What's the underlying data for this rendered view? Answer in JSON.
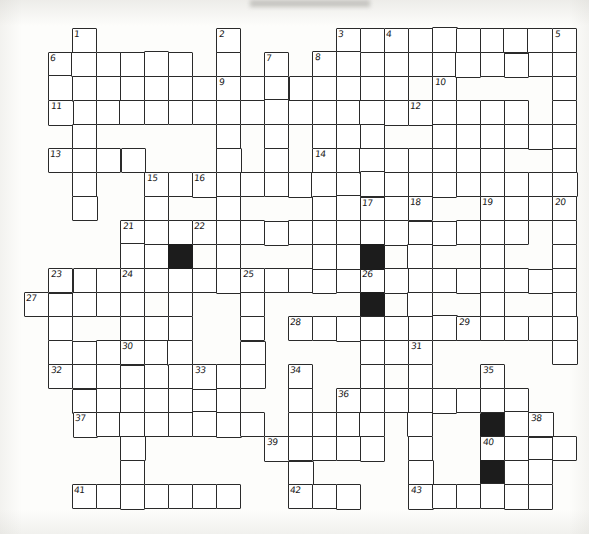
{
  "document": {
    "type": "crossword-puzzle-grid",
    "title": "Crossword puzzle grid",
    "cell_size": 24,
    "origin_x": 24,
    "origin_y": 28,
    "columns": 23,
    "rows": 21,
    "ink_color": "#2a2a2a",
    "blocked_color": "#1c1c1c",
    "paper_color": "#fdfdfb"
  },
  "grid": {
    "white_cells": [
      [
        2,
        1
      ],
      [
        2,
        2
      ],
      [
        2,
        3
      ],
      [
        1,
        2
      ],
      [
        3,
        2
      ],
      [
        4,
        2
      ],
      [
        5,
        2
      ],
      [
        6,
        2
      ],
      [
        7,
        2
      ],
      [
        8,
        1
      ],
      [
        8,
        2
      ],
      [
        8,
        3
      ],
      [
        8,
        4
      ],
      [
        8,
        5
      ],
      [
        8,
        6
      ],
      [
        8,
        7
      ],
      [
        8,
        8
      ],
      [
        10,
        2
      ],
      [
        10,
        3
      ],
      [
        10,
        4
      ],
      [
        10,
        5
      ],
      [
        12,
        1
      ],
      [
        12,
        2
      ],
      [
        12,
        3
      ],
      [
        12,
        4
      ],
      [
        12,
        5
      ],
      [
        13,
        1
      ],
      [
        13,
        2
      ],
      [
        13,
        3
      ],
      [
        13,
        4
      ],
      [
        13,
        5
      ],
      [
        13,
        6
      ],
      [
        13,
        7
      ],
      [
        13,
        8
      ],
      [
        13,
        9
      ],
      [
        13,
        10
      ],
      [
        14,
        1
      ],
      [
        15,
        1
      ],
      [
        16,
        1
      ],
      [
        17,
        1
      ],
      [
        18,
        1
      ],
      [
        19,
        1
      ],
      [
        20,
        1
      ],
      [
        21,
        1
      ],
      [
        22,
        1
      ],
      [
        22,
        2
      ],
      [
        22,
        3
      ],
      [
        22,
        4
      ],
      [
        22,
        5
      ],
      [
        22,
        6
      ],
      [
        22,
        7
      ],
      [
        22,
        8
      ],
      [
        14,
        2
      ],
      [
        14,
        3
      ],
      [
        14,
        4
      ],
      [
        14,
        5
      ],
      [
        1,
        3
      ],
      [
        2,
        3
      ],
      [
        3,
        3
      ],
      [
        4,
        3
      ],
      [
        5,
        3
      ],
      [
        6,
        3
      ],
      [
        7,
        3
      ],
      [
        8,
        3
      ],
      [
        9,
        3
      ],
      [
        10,
        3
      ],
      [
        11,
        3
      ],
      [
        12,
        3
      ],
      [
        13,
        3
      ],
      [
        17,
        3
      ],
      [
        18,
        3
      ],
      [
        19,
        3
      ],
      [
        20,
        3
      ],
      [
        18,
        4
      ],
      [
        19,
        4
      ],
      [
        20,
        4
      ],
      [
        21,
        4
      ],
      [
        1,
        5
      ],
      [
        2,
        5
      ],
      [
        3,
        5
      ],
      [
        4,
        5
      ],
      [
        6,
        6
      ],
      [
        7,
        6
      ],
      [
        8,
        6
      ],
      [
        9,
        6
      ],
      [
        10,
        6
      ],
      [
        11,
        6
      ],
      [
        12,
        6
      ],
      [
        5,
        6
      ],
      [
        5,
        7
      ],
      [
        5,
        8
      ],
      [
        13,
        6
      ],
      [
        14,
        6
      ],
      [
        15,
        6
      ],
      [
        16,
        6
      ],
      [
        17,
        6
      ],
      [
        18,
        6
      ],
      [
        19,
        6
      ],
      [
        20,
        6
      ],
      [
        21,
        6
      ],
      [
        22,
        6
      ],
      [
        4,
        8
      ],
      [
        5,
        8
      ],
      [
        6,
        8
      ],
      [
        7,
        8
      ],
      [
        8,
        8
      ],
      [
        9,
        8
      ],
      [
        10,
        8
      ],
      [
        11,
        8
      ],
      [
        12,
        8
      ],
      [
        13,
        8
      ],
      [
        1,
        10
      ],
      [
        2,
        10
      ],
      [
        3,
        10
      ],
      [
        4,
        10
      ],
      [
        5,
        10
      ],
      [
        0,
        11
      ],
      [
        1,
        11
      ],
      [
        2,
        11
      ],
      [
        3,
        11
      ],
      [
        4,
        12
      ],
      [
        5,
        12
      ],
      [
        6,
        12
      ],
      [
        1,
        13
      ],
      [
        2,
        13
      ],
      [
        3,
        13
      ],
      [
        4,
        13
      ],
      [
        5,
        13
      ],
      [
        6,
        13
      ],
      [
        2,
        15
      ],
      [
        3,
        15
      ],
      [
        4,
        15
      ],
      [
        5,
        15
      ],
      [
        6,
        15
      ],
      [
        7,
        15
      ],
      [
        8,
        15
      ],
      [
        2,
        19
      ],
      [
        3,
        19
      ],
      [
        4,
        19
      ],
      [
        5,
        19
      ],
      [
        6,
        19
      ],
      [
        7,
        19
      ]
    ],
    "blocked_cells": [
      [
        6,
        9
      ],
      [
        14,
        9
      ],
      [
        14,
        11
      ],
      [
        19,
        16
      ],
      [
        19,
        18
      ]
    ],
    "numbered_cells": [
      {
        "number": "1",
        "col": 2,
        "row": 0
      },
      {
        "number": "2",
        "col": 8,
        "row": 0
      },
      {
        "number": "3",
        "col": 13,
        "row": 0
      },
      {
        "number": "4",
        "col": 15,
        "row": 0
      },
      {
        "number": "5",
        "col": 22,
        "row": 0
      },
      {
        "number": "6",
        "col": 1,
        "row": 1
      },
      {
        "number": "7",
        "col": 10,
        "row": 1
      },
      {
        "number": "8",
        "col": 12,
        "row": 1
      },
      {
        "number": "9",
        "col": 8,
        "row": 2
      },
      {
        "number": "10",
        "col": 17,
        "row": 2
      },
      {
        "number": "11",
        "col": 1,
        "row": 3
      },
      {
        "number": "12",
        "col": 16,
        "row": 3
      },
      {
        "number": "13",
        "col": 1,
        "row": 5
      },
      {
        "number": "14",
        "col": 12,
        "row": 5
      },
      {
        "number": "15",
        "col": 5,
        "row": 6
      },
      {
        "number": "16",
        "col": 7,
        "row": 6
      },
      {
        "number": "17",
        "col": 14,
        "row": 7
      },
      {
        "number": "18",
        "col": 16,
        "row": 7
      },
      {
        "number": "19",
        "col": 19,
        "row": 7
      },
      {
        "number": "20",
        "col": 22,
        "row": 7
      },
      {
        "number": "21",
        "col": 4,
        "row": 8
      },
      {
        "number": "22",
        "col": 7,
        "row": 8
      },
      {
        "number": "23",
        "col": 1,
        "row": 10
      },
      {
        "number": "24",
        "col": 4,
        "row": 10
      },
      {
        "number": "25",
        "col": 9,
        "row": 10
      },
      {
        "number": "26",
        "col": 14,
        "row": 10
      },
      {
        "number": "27",
        "col": 0,
        "row": 11
      },
      {
        "number": "28",
        "col": 11,
        "row": 12
      },
      {
        "number": "29",
        "col": 18,
        "row": 12
      },
      {
        "number": "30",
        "col": 4,
        "row": 13
      },
      {
        "number": "31",
        "col": 16,
        "row": 13
      },
      {
        "number": "32",
        "col": 1,
        "row": 14
      },
      {
        "number": "33",
        "col": 7,
        "row": 14
      },
      {
        "number": "34",
        "col": 11,
        "row": 14
      },
      {
        "number": "35",
        "col": 19,
        "row": 14
      },
      {
        "number": "36",
        "col": 13,
        "row": 15
      },
      {
        "number": "37",
        "col": 2,
        "row": 16
      },
      {
        "number": "38",
        "col": 21,
        "row": 16
      },
      {
        "number": "39",
        "col": 10,
        "row": 17
      },
      {
        "number": "40",
        "col": 19,
        "row": 17
      },
      {
        "number": "41",
        "col": 2,
        "row": 19
      },
      {
        "number": "42",
        "col": 11,
        "row": 19
      },
      {
        "number": "43",
        "col": 16,
        "row": 19
      }
    ],
    "rows_layout": [
      {
        "row": 0,
        "runs": [
          [
            2,
            2
          ],
          [
            8,
            8
          ],
          [
            13,
            22
          ]
        ]
      },
      {
        "row": 1,
        "runs": [
          [
            1,
            6
          ],
          [
            2,
            2
          ],
          [
            8,
            8
          ],
          [
            10,
            10
          ],
          [
            12,
            13
          ],
          [
            15,
            15
          ],
          [
            22,
            22
          ]
        ]
      },
      {
        "row": 2,
        "runs": [
          [
            2,
            2
          ],
          [
            8,
            14
          ],
          [
            15,
            15
          ],
          [
            17,
            17
          ],
          [
            22,
            22
          ]
        ]
      },
      {
        "row": 3,
        "runs": [
          [
            1,
            13
          ],
          [
            15,
            15
          ],
          [
            16,
            19
          ],
          [
            22,
            22
          ]
        ]
      },
      {
        "row": 4,
        "runs": [
          [
            2,
            2
          ],
          [
            8,
            8
          ],
          [
            10,
            10
          ],
          [
            12,
            12
          ],
          [
            17,
            17
          ],
          [
            22,
            22
          ]
        ]
      },
      {
        "row": 5,
        "runs": [
          [
            1,
            4
          ],
          [
            8,
            8
          ],
          [
            10,
            10
          ],
          [
            12,
            19
          ],
          [
            22,
            22
          ]
        ]
      },
      {
        "row": 6,
        "runs": [
          [
            2,
            2
          ],
          [
            5,
            5
          ],
          [
            7,
            13
          ],
          [
            14,
            17
          ],
          [
            19,
            22
          ]
        ]
      },
      {
        "row": 7,
        "runs": [
          [
            2,
            2
          ],
          [
            5,
            5
          ],
          [
            8,
            8
          ],
          [
            12,
            12
          ],
          [
            14,
            16
          ],
          [
            19,
            22
          ]
        ]
      },
      {
        "row": 8,
        "runs": [
          [
            4,
            20
          ],
          [
            22,
            22
          ]
        ]
      },
      {
        "row": 9,
        "runs": [
          [
            4,
            4
          ],
          [
            5,
            5
          ],
          [
            6,
            6
          ],
          [
            8,
            8
          ],
          [
            12,
            12
          ],
          [
            14,
            14
          ],
          [
            16,
            16
          ],
          [
            19,
            19
          ],
          [
            22,
            22
          ]
        ]
      },
      {
        "row": 10,
        "runs": [
          [
            1,
            1
          ],
          [
            4,
            12
          ],
          [
            9,
            9
          ],
          [
            14,
            21
          ],
          [
            22,
            22
          ]
        ]
      },
      {
        "row": 11,
        "runs": [
          [
            0,
            4
          ],
          [
            6,
            6
          ],
          [
            9,
            9
          ],
          [
            14,
            14
          ],
          [
            16,
            16
          ],
          [
            19,
            19
          ],
          [
            22,
            22
          ]
        ]
      },
      {
        "row": 12,
        "runs": [
          [
            1,
            1
          ],
          [
            6,
            6
          ],
          [
            9,
            9
          ],
          [
            11,
            17
          ],
          [
            14,
            14
          ],
          [
            16,
            16
          ],
          [
            18,
            22
          ]
        ]
      },
      {
        "row": 13,
        "runs": [
          [
            1,
            1
          ],
          [
            4,
            4
          ],
          [
            6,
            6
          ],
          [
            9,
            9
          ],
          [
            14,
            16
          ],
          [
            22,
            22
          ]
        ]
      },
      {
        "row": 14,
        "runs": [
          [
            1,
            8
          ],
          [
            6,
            6
          ],
          [
            9,
            9
          ],
          [
            11,
            11
          ],
          [
            14,
            14
          ],
          [
            16,
            16
          ],
          [
            19,
            19
          ]
        ]
      },
      {
        "row": 15,
        "runs": [
          [
            4,
            4
          ],
          [
            6,
            6
          ],
          [
            8,
            8
          ],
          [
            11,
            11
          ],
          [
            13,
            20
          ],
          [
            16,
            16
          ],
          [
            19,
            19
          ]
        ]
      },
      {
        "row": 16,
        "runs": [
          [
            2,
            9
          ],
          [
            4,
            4
          ],
          [
            11,
            14
          ],
          [
            16,
            16
          ],
          [
            19,
            21
          ],
          [
            21,
            21
          ]
        ]
      },
      {
        "row": 17,
        "runs": [
          [
            4,
            4
          ],
          [
            10,
            14
          ],
          [
            11,
            11
          ],
          [
            16,
            16
          ],
          [
            19,
            22
          ]
        ]
      },
      {
        "row": 18,
        "runs": [
          [
            4,
            4
          ],
          [
            11,
            11
          ],
          [
            16,
            16
          ],
          [
            19,
            21
          ]
        ]
      },
      {
        "row": 19,
        "runs": [
          [
            2,
            8
          ],
          [
            11,
            13
          ],
          [
            16,
            21
          ]
        ]
      }
    ]
  },
  "notes": {
    "style": "hand-drawn pen-and-ink crossword grid on white paper, no letters filled in",
    "letters_filled": "none"
  }
}
